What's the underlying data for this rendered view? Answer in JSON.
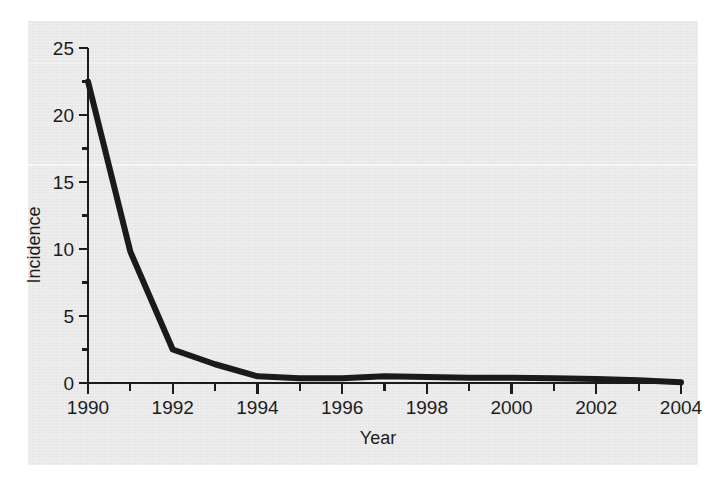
{
  "chart_data": {
    "type": "line",
    "title": "",
    "xlabel": "Year",
    "ylabel": "Incidence",
    "xlim": [
      1990,
      2004
    ],
    "ylim": [
      0,
      25
    ],
    "grid": false,
    "legend": "none",
    "x_major_ticks": [
      1990,
      1992,
      1994,
      1996,
      1998,
      2000,
      2002,
      2004
    ],
    "x_tick_labels": [
      "1990",
      "1992",
      "1994",
      "1996",
      "1998",
      "2000",
      "2002",
      "2004"
    ],
    "x_minor_tick_interval": 1,
    "y_major_ticks": [
      0,
      5,
      10,
      15,
      20,
      25
    ],
    "y_tick_labels": [
      "0",
      "5",
      "10",
      "15",
      "20",
      "25"
    ],
    "y_minor_tick_interval": 2.5,
    "series": [
      {
        "name": "Incidence",
        "color": "#1a1a1a",
        "line_width": 6,
        "x": [
          1990,
          1991,
          1992,
          1993,
          1994,
          1995,
          1996,
          1997,
          1998,
          1999,
          2000,
          2001,
          2002,
          2003,
          2004
        ],
        "values": [
          22.5,
          9.8,
          2.5,
          1.4,
          0.5,
          0.35,
          0.35,
          0.5,
          0.45,
          0.4,
          0.4,
          0.35,
          0.3,
          0.2,
          0.05
        ]
      }
    ]
  },
  "axes": {
    "y_title": "Incidence",
    "x_title": "Year"
  },
  "colors": {
    "line": "#1a1a1a",
    "axis": "#1c1c1c",
    "paper": "#ebebeb",
    "page": "#ffffff"
  }
}
